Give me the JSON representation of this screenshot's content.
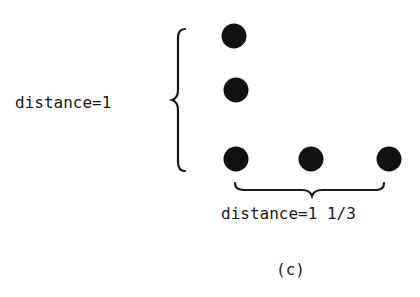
{
  "diagram": {
    "vertical_label": "distance=1",
    "horizontal_label": "distance=1 1/3",
    "caption": "(c)",
    "dot_color": "#111111",
    "dots": [
      {
        "cx": 234,
        "cy": 36
      },
      {
        "cx": 236,
        "cy": 90
      },
      {
        "cx": 236,
        "cy": 159
      },
      {
        "cx": 311,
        "cy": 159
      },
      {
        "cx": 389,
        "cy": 159
      }
    ]
  }
}
